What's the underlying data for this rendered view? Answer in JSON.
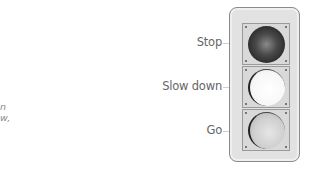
{
  "left_fragment": {
    "lines": [
      "n",
      "w,"
    ]
  },
  "diagram": {
    "type": "traffic-light",
    "labels": [
      {
        "text": "Stop",
        "lamp": "top",
        "state": "dark"
      },
      {
        "text": "Slow down",
        "lamp": "middle",
        "state": "lit-white"
      },
      {
        "text": "Go",
        "lamp": "bottom",
        "state": "light-gray"
      }
    ]
  },
  "colors": {
    "housing": "#e2e2e2",
    "housing_border": "#8a8a8a",
    "panel": "#d9d9d9",
    "lamp_stop": "#2a2a2a",
    "lamp_slow": "#f7f7f7",
    "lamp_go": "#cfcfcf",
    "label_text": "#666666"
  }
}
